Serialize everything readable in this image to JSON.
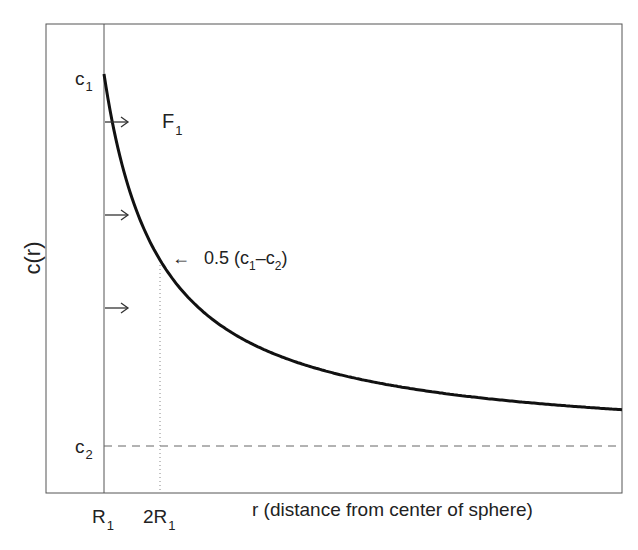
{
  "chart_data": {
    "type": "line",
    "title": "",
    "xlabel": "r (distance from center of sphere)",
    "ylabel": "c(r)",
    "x_ticks": [
      {
        "label": "R",
        "sub": "1",
        "r_over_R1": 1
      },
      {
        "label": "2R",
        "sub": "1",
        "r_over_R1": 2
      }
    ],
    "y_ticks": [
      {
        "label": "c",
        "sub": "1"
      },
      {
        "label": "c",
        "sub": "2"
      }
    ],
    "series": [
      {
        "name": "c(r) = c2 + (c1 - c2) R1 / r",
        "x_r_over_R1": [
          1,
          1.5,
          2,
          3,
          4,
          5,
          6,
          7,
          8,
          9,
          10,
          10.25
        ],
        "y_fraction_of_c1_minus_c2_above_c2": [
          1.0,
          0.667,
          0.5,
          0.333,
          0.25,
          0.2,
          0.167,
          0.143,
          0.125,
          0.111,
          0.1,
          0.098
        ]
      }
    ],
    "reference_lines": [
      {
        "type": "horizontal-dashed",
        "at": "c2"
      },
      {
        "type": "vertical-dotted",
        "at": "2R1"
      },
      {
        "type": "vertical-solid",
        "at": "R1"
      }
    ],
    "annotations": {
      "flux_label": "F",
      "flux_sub": "1",
      "half_label_prefix": "0.5 (c",
      "half_sub1": "1",
      "half_mid": "–c",
      "half_sub2": "2",
      "half_suffix": ")",
      "arrow_left": "←"
    },
    "grid": false,
    "legend": "none"
  }
}
